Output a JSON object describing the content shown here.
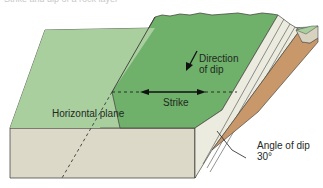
{
  "caption": "Strike and dip of a rock layer",
  "labels": {
    "direction_of_dip_line1": "Direction",
    "direction_of_dip_line2": "of dip",
    "strike": "Strike",
    "horizontal_plane": "Horizontal plane",
    "angle_of_dip": "Angle of dip",
    "angle_value": "30°"
  },
  "colors": {
    "horizontal_plane": "#a9cf9f",
    "dipping_bed_top": "#6fb06a",
    "front_face": "#ddd9c8",
    "side_face": "#d6cfbb",
    "strata": "#ecebe0",
    "soil": "#c8976a",
    "outline": "#4a4a44"
  }
}
